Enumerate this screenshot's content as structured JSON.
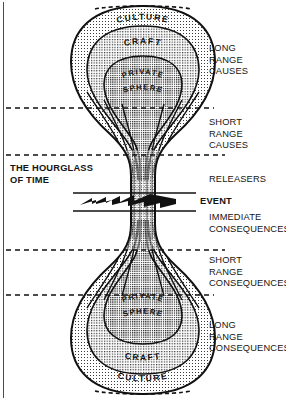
{
  "figure": {
    "title": "The Hourglass of Time",
    "type": "conceptual-diagram",
    "background_color": "#ffffff",
    "ink_color": "#111111"
  },
  "diagram": {
    "caption_label": "THE HOURGLASS\nOF TIME",
    "event_label": "EVENT",
    "event_marker": "zigzag-band",
    "rings_top": [
      {
        "id": "culture-top",
        "label": "CULTURE"
      },
      {
        "id": "craft-top",
        "label": "CRAFT"
      },
      {
        "id": "private-sphere-top",
        "label": "PRIVATE SPHERE",
        "line1": "PRIVATE",
        "line2": "SPHERE"
      }
    ],
    "rings_bottom": [
      {
        "id": "private-sphere-bottom",
        "label": "PRIVATE SPHERE",
        "line1": "PRIVATE",
        "line2": "SPHERE"
      },
      {
        "id": "craft-bottom",
        "label": "CRAFT"
      },
      {
        "id": "culture-bottom",
        "label": "CULTURE"
      }
    ]
  },
  "right_labels": [
    {
      "id": "long-range-causes",
      "text": "LONG\nRANGE\nCAUSES",
      "x": 209,
      "y": 43
    },
    {
      "id": "short-range-causes",
      "text": "SHORT\nRANGE\nCAUSES",
      "x": 209,
      "y": 117
    },
    {
      "id": "releasers",
      "text": "RELEASERS",
      "x": 209,
      "y": 174
    },
    {
      "id": "immediate-consequences",
      "text": "IMMEDIATE\nCONSEQUENCES",
      "x": 209,
      "y": 212
    },
    {
      "id": "short-range-consequences",
      "text": "SHORT\nRANGE\nCONSEQUENCES",
      "x": 209,
      "y": 255
    },
    {
      "id": "long-range-consequences",
      "text": "LONG\nRANGE\nCONSEQUENCES",
      "x": 209,
      "y": 320
    }
  ],
  "dividers": [
    {
      "id": "divider-long-short-causes",
      "y": 108
    },
    {
      "id": "divider-short-causes-releasers",
      "y": 155
    },
    {
      "id": "divider-immediate-short-consequences",
      "y": 250
    },
    {
      "id": "divider-short-long-consequences",
      "y": 295
    }
  ]
}
